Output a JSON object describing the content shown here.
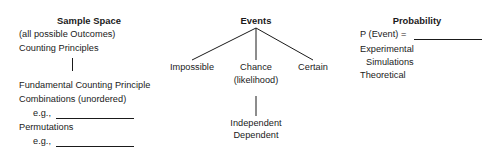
{
  "diagram": {
    "title_hidden": "Probability concept map",
    "columns": [
      {
        "id": "sample-space",
        "heading": "Sample Space",
        "lines": [
          "(all possible Outcomes)",
          "Counting Principles",
          "Fundamental Counting Principle",
          "Combinations (unordered)",
          "e.g.,",
          "Permutations",
          "e.g.,"
        ]
      },
      {
        "id": "events",
        "heading": "Events",
        "branches": [
          {
            "label": "Impossible"
          },
          {
            "label": "Chance",
            "sublabel": "(likelihood)"
          },
          {
            "label": "Certain"
          }
        ],
        "chance_children": [
          "Independent",
          "Dependent"
        ]
      },
      {
        "id": "probability",
        "heading": "Probability",
        "formula": "P (Event) =",
        "lines": [
          "Experimental",
          "Simulations",
          "Theoretical"
        ]
      }
    ],
    "colors": {
      "ink": "#1a1a1a",
      "background": "#ffffff"
    }
  }
}
